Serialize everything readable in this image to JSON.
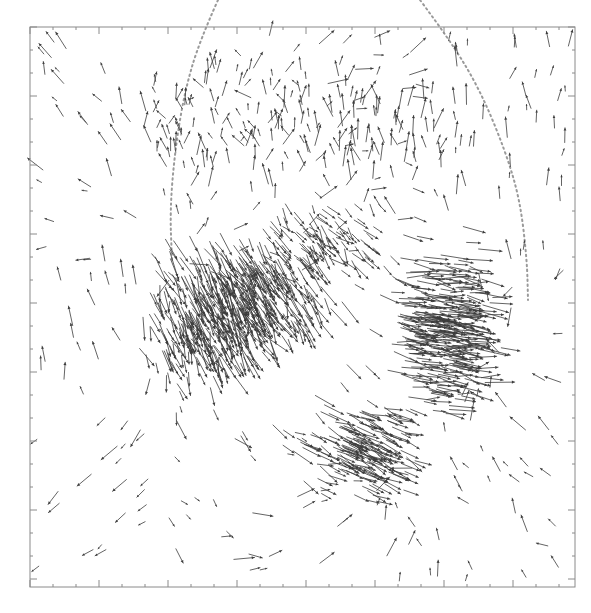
{
  "chart_data": {
    "type": "quiver",
    "title": "",
    "xlabel": "",
    "ylabel": "",
    "legend": [],
    "grid": false,
    "frame_px": {
      "x0": 30,
      "y0": 27,
      "x1": 575,
      "y1": 587
    },
    "ticks": {
      "major_spacing_px": 69,
      "minor_spacing_px": 23,
      "labels": []
    },
    "colors": {
      "arrows": "#3c3c3c",
      "frame": "#8a8a8a",
      "dotted_curves": "#9a9a9a",
      "background": "#ffffff"
    },
    "sources": [
      {
        "name": "west-pole-cluster",
        "x": 175,
        "y": 265,
        "sign": 1,
        "strength": 1.0,
        "description": "divergent arrows, dense leftward/downward fan"
      },
      {
        "name": "east-pole-cluster",
        "x": 490,
        "y": 345,
        "sign": -1,
        "strength": 1.0,
        "description": "convergent arrows, dense crescent pointing right"
      },
      {
        "name": "south-cluster",
        "x": 385,
        "y": 470,
        "sign": -1,
        "strength": 0.55,
        "description": "convergent arrows from lower-left"
      },
      {
        "name": "center-east-ridge",
        "x": 300,
        "y": 275,
        "sign": 1,
        "strength": 0.5,
        "description": "dense band of arrows pointing right-down"
      }
    ],
    "dotted_curves": [
      {
        "name": "left-arc",
        "points": [
          [
            218,
            0
          ],
          [
            200,
            40
          ],
          [
            185,
            90
          ],
          [
            175,
            150
          ],
          [
            170,
            210
          ],
          [
            172,
            260
          ]
        ]
      },
      {
        "name": "right-arc",
        "points": [
          [
            420,
            0
          ],
          [
            450,
            40
          ],
          [
            480,
            90
          ],
          [
            505,
            150
          ],
          [
            520,
            200
          ],
          [
            527,
            260
          ],
          [
            528,
            300
          ]
        ]
      }
    ],
    "arrow_count_approx": 1400,
    "arrow_length_range_px": [
      4,
      30
    ]
  }
}
